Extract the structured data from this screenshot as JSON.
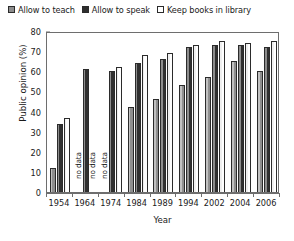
{
  "chart_data": {
    "type": "bar",
    "title": "",
    "xlabel": "Year",
    "ylabel": "Public opinion (%)",
    "ylim": [
      0,
      80
    ],
    "ytick_step": 10,
    "yticks": [
      0,
      10,
      20,
      30,
      40,
      50,
      60,
      70,
      80
    ],
    "grid": false,
    "legend_position": "top",
    "categories": [
      "1954",
      "1964",
      "1974",
      "1984",
      "1989",
      "1994",
      "2002",
      "2004",
      "2006"
    ],
    "series": [
      {
        "name": "Allow to teach",
        "color": "#8f8f8f",
        "values": [
          12,
          null,
          null,
          42,
          46,
          53,
          57,
          65,
          60
        ],
        "missing_label": "no data"
      },
      {
        "name": "Allow to speak",
        "color": "#303030",
        "values": [
          34,
          61,
          60,
          64,
          66,
          72,
          73,
          73,
          72
        ],
        "missing_label": "no data"
      },
      {
        "name": "Keep books in library",
        "color": "#ffffff",
        "values": [
          37,
          null,
          62,
          68,
          69,
          73,
          75,
          74,
          75
        ],
        "missing_label": "no data"
      }
    ],
    "annotations": [
      {
        "category": "1964",
        "series": "Allow to teach",
        "text": "no data"
      },
      {
        "category": "1974",
        "series": "Allow to teach",
        "text": "no data"
      }
    ]
  },
  "legend": {
    "items": [
      {
        "label": "Allow to teach",
        "swatch": "teach"
      },
      {
        "label": "Allow to speak",
        "swatch": "speak"
      },
      {
        "label": "Keep books in library",
        "swatch": "books"
      }
    ]
  }
}
